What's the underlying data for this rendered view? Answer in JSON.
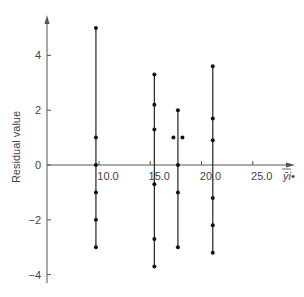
{
  "chart_data": {
    "type": "scatter",
    "title": "",
    "xlabel": "ȳi•",
    "ylabel": "Residual value",
    "xlim": [
      5.2,
      30
    ],
    "ylim": [
      -4.5,
      5.5
    ],
    "x_ticks": [
      "10.0",
      "15.0",
      "20.0",
      "25.0"
    ],
    "x_tick_values": [
      10,
      15,
      20,
      25
    ],
    "y_ticks": [
      "4",
      "2",
      "0",
      "-2",
      "-4"
    ],
    "y_tick_values": [
      4,
      2,
      0,
      -2,
      -4
    ],
    "grid": false,
    "legend": null,
    "groups": [
      {
        "x": 9.7,
        "residuals": [
          5,
          1,
          0,
          -1,
          -2,
          -3
        ]
      },
      {
        "x": 15.4,
        "residuals": [
          3.3,
          2.2,
          1.3,
          -0.7,
          -2.7,
          -3.7
        ]
      },
      {
        "x": 17.7,
        "residuals": [
          2,
          1,
          1,
          0,
          -1,
          -3
        ],
        "note": "two points at 1 plotted side by side"
      },
      {
        "x": 21.1,
        "residuals": [
          3.6,
          1.7,
          0.9,
          -1.2,
          -2.2,
          -3.2
        ]
      }
    ]
  }
}
